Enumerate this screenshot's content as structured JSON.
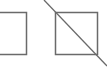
{
  "icons": [
    {
      "name": "square-outline-icon",
      "shape": "rect"
    },
    {
      "name": "square-slash-icon",
      "shape": "rect-with-diagonal"
    }
  ],
  "colors": {
    "stroke": "#6a6a6a",
    "background": "#ffffff"
  }
}
